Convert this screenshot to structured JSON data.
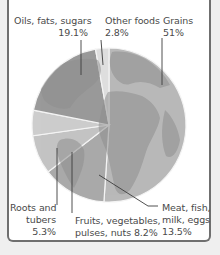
{
  "chart_data": {
    "type": "pie",
    "title": "",
    "start_angle_deg": 0,
    "direction": "clockwise",
    "categories": [
      "Grains",
      "Meat, fish, milk, eggs",
      "Fruits, vegetables, pulses, nuts",
      "Roots and tubers",
      "Oils, fats, sugars",
      "Other foods"
    ],
    "values": [
      51,
      13.5,
      8.2,
      5.3,
      19.1,
      2.8
    ],
    "units": "%",
    "background_image": "world-globe"
  },
  "labels": {
    "oils": {
      "line1": "Oils, fats, sugars",
      "line2": "19.1%"
    },
    "other": {
      "line1": "Other foods",
      "line2": "2.8%"
    },
    "grains": {
      "line1": "Grains",
      "line2": "51%"
    },
    "roots": {
      "line1": "Roots and",
      "line2": "tubers",
      "line3": "5.3%"
    },
    "fruits": {
      "line1": "Fruits, vegetables,",
      "line2": "pulses, nuts  8.2%"
    },
    "meat": {
      "line1": "Meat, fish,",
      "line2": "milk, eggs",
      "line3": "13.5%"
    }
  },
  "colors": {
    "grains": "#b9b9b9",
    "meat": "#a9a9a9",
    "fruits": "#c4c4c4",
    "roots": "#cdcdcd",
    "oils": "#9a9a9a",
    "other": "#dedede",
    "land": "#8e8e8e",
    "leader": "#3c3c3c"
  }
}
